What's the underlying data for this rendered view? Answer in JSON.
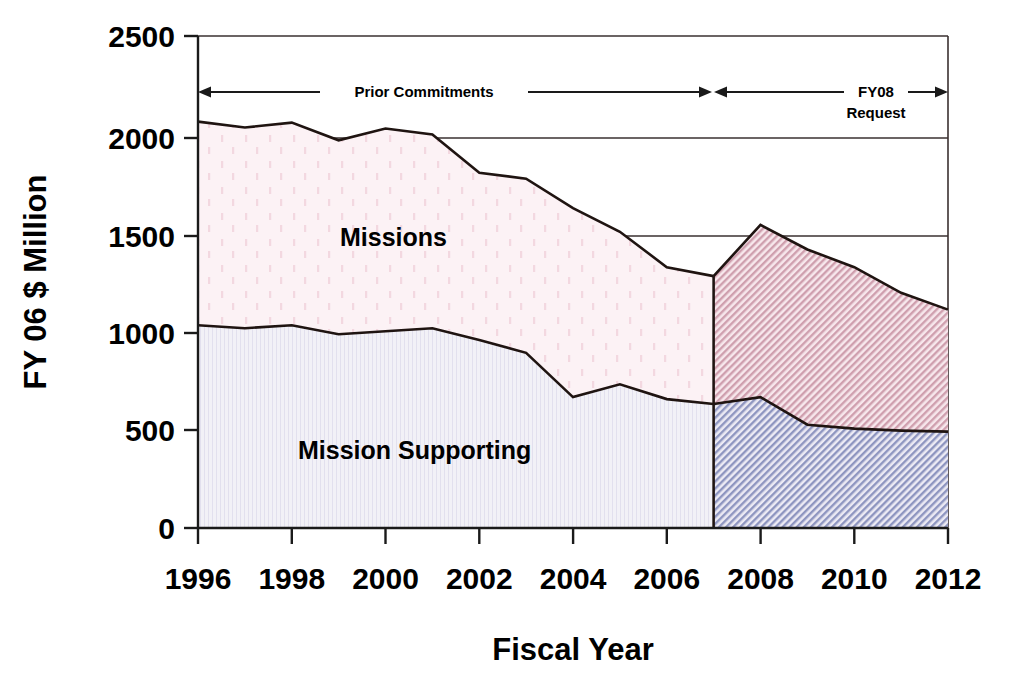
{
  "chart_data": {
    "type": "area",
    "title": "",
    "xlabel": "Fiscal Year",
    "ylabel": "FY 06 $ Million",
    "xlim": [
      1996,
      2012
    ],
    "ylim": [
      0,
      2500
    ],
    "xticks": [
      "1996",
      "1998",
      "2000",
      "2002",
      "2004",
      "2006",
      "2008",
      "2010",
      "2012"
    ],
    "xtick_values": [
      1996,
      1998,
      2000,
      2002,
      2004,
      2006,
      2008,
      2010,
      2012
    ],
    "yticks": [
      "0",
      "500",
      "1000",
      "1500",
      "2000",
      "2500"
    ],
    "ytick_values": [
      0,
      500,
      1000,
      1500,
      2000,
      2500
    ],
    "grid": false,
    "legend": "inline-labels",
    "stacked": true,
    "x": [
      1996,
      1997,
      1998,
      1999,
      2000,
      2001,
      2002,
      2003,
      2004,
      2005,
      2006,
      2007,
      2008,
      2009,
      2010,
      2011,
      2012
    ],
    "series": [
      {
        "name": "Mission Supporting",
        "label": "Mission Supporting",
        "color": "#e8e8f0",
        "values": [
          1030,
          1015,
          1030,
          985,
          1000,
          1015,
          955,
          890,
          665,
          730,
          655,
          630,
          665,
          525,
          505,
          495,
          490
        ]
      },
      {
        "name": "Missions",
        "label": "Missions",
        "color": "#fbeef2",
        "stacked_top_values": [
          2065,
          2035,
          2060,
          1970,
          2030,
          2000,
          1805,
          1775,
          1625,
          1505,
          1325,
          1280,
          1540,
          1415,
          1325,
          1195,
          1110
        ],
        "values": [
          1035,
          1020,
          1030,
          985,
          1030,
          985,
          850,
          885,
          960,
          775,
          670,
          650,
          875,
          890,
          820,
          700,
          620
        ]
      }
    ],
    "annotations": [
      {
        "id": "prior-commitments",
        "text": "Prior Commitments",
        "from_year": 1996,
        "to_year": 2007
      },
      {
        "id": "fy08-request",
        "text_line1": "FY08",
        "text_line2": "Request",
        "from_year": 2007,
        "to_year": 2012
      }
    ],
    "regions": [
      {
        "id": "prior-commitments-region",
        "from_year": 1996,
        "to_year": 2007,
        "fill_style": "dotted-light"
      },
      {
        "id": "fy08-request-region",
        "from_year": 2007,
        "to_year": 2012,
        "fill_style": "hatched"
      }
    ]
  },
  "labels": {
    "y_axis_title": "FY 06 $ Million",
    "x_axis_title": "Fiscal Year",
    "series_missions": "Missions",
    "series_mission_supporting": "Mission Supporting",
    "annot_prior_commitments": "Prior Commitments",
    "annot_fy08_line1": "FY08",
    "annot_fy08_line2": "Request"
  },
  "ytick_labels": {
    "t0": "0",
    "t1": "500",
    "t2": "1000",
    "t3": "1500",
    "t4": "2000",
    "t5": "2500"
  },
  "xtick_labels": {
    "t0": "1996",
    "t1": "1998",
    "t2": "2000",
    "t3": "2002",
    "t4": "2004",
    "t5": "2006",
    "t6": "2008",
    "t7": "2010",
    "t8": "2012"
  },
  "colors": {
    "missions_fill": "#fbeef2",
    "mission_supporting_fill": "#eceaf3",
    "missions_hatch": "#d9aab6",
    "mission_supporting_hatch": "#9aa0c4",
    "line": "#1f1411",
    "axis": "#1a1a1a",
    "background": "#ffffff"
  }
}
